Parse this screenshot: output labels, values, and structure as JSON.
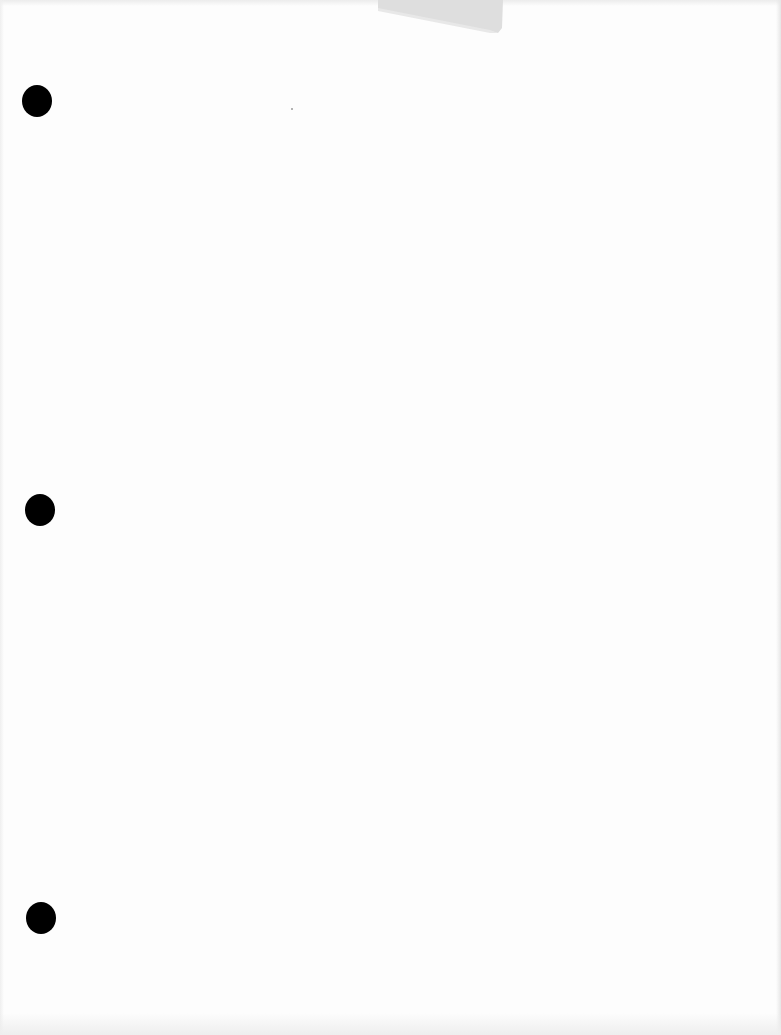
{
  "document": {
    "type": "blank scanned page",
    "background_color": "#fdfdfd",
    "text_content": "",
    "punch_holes": [
      {
        "cx": 37,
        "cy": 101,
        "color": "#000000"
      },
      {
        "cx": 40,
        "cy": 510,
        "color": "#000000"
      },
      {
        "cx": 41,
        "cy": 918,
        "color": "#000000"
      }
    ],
    "tape": {
      "color": "#dedede",
      "position": "top-center"
    }
  }
}
